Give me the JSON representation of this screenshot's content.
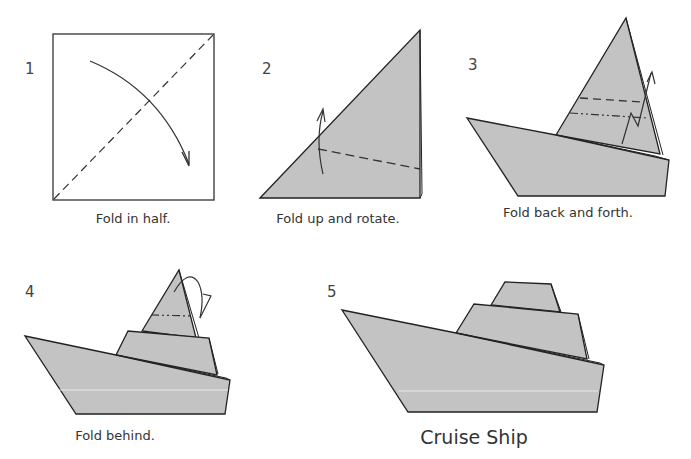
{
  "diagram": {
    "title": "Cruise Ship",
    "paper_color": "#c3c3c3",
    "line_color": "#222222",
    "steps": [
      {
        "number": "1",
        "caption": "Fold in half."
      },
      {
        "number": "2",
        "caption": "Fold up and rotate."
      },
      {
        "number": "3",
        "caption": "Fold back and forth."
      },
      {
        "number": "4",
        "caption": "Fold behind."
      },
      {
        "number": "5",
        "caption": "Cruise Ship"
      }
    ]
  }
}
